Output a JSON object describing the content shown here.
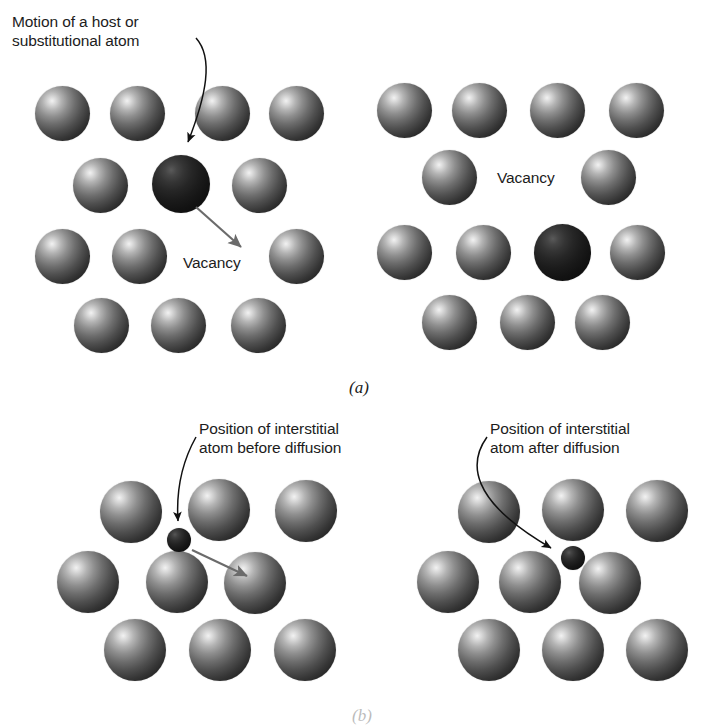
{
  "figure": {
    "captions": {
      "a": "(a)",
      "b": "(b)"
    }
  },
  "colors": {
    "background": "#ffffff",
    "atom_light": "#8e8e8e",
    "atom_dark": "#262626",
    "text": "#1c1c1c",
    "arrow_black": "#111111",
    "arrow_gray": "#6b6b6b"
  },
  "panel_a": {
    "name": "vacancy-diffusion",
    "caption": "(a)",
    "left": {
      "annotations": {
        "motion_label": "Motion of a host or substitutional atom",
        "motion_label_line1": "Motion of a host or",
        "motion_label_line2": "substitutional atom",
        "vacancy_label": "Vacancy"
      },
      "atoms": [
        {
          "cx": 62,
          "cy": 113,
          "r": 27.5,
          "kind": "light"
        },
        {
          "cx": 137,
          "cy": 113,
          "r": 27.5,
          "kind": "light"
        },
        {
          "cx": 222,
          "cy": 113,
          "r": 27.5,
          "kind": "light"
        },
        {
          "cx": 296,
          "cy": 113,
          "r": 27.5,
          "kind": "light"
        },
        {
          "cx": 100,
          "cy": 185,
          "r": 27.5,
          "kind": "light"
        },
        {
          "cx": 181,
          "cy": 184,
          "r": 29.0,
          "kind": "dark"
        },
        {
          "cx": 259,
          "cy": 185,
          "r": 27.5,
          "kind": "light"
        },
        {
          "cx": 62,
          "cy": 256,
          "r": 27.5,
          "kind": "light"
        },
        {
          "cx": 139,
          "cy": 256,
          "r": 27.5,
          "kind": "light"
        },
        {
          "cx": 296,
          "cy": 256,
          "r": 27.5,
          "kind": "light"
        },
        {
          "cx": 101,
          "cy": 325,
          "r": 27.5,
          "kind": "light"
        },
        {
          "cx": 178,
          "cy": 325,
          "r": 27.5,
          "kind": "light"
        },
        {
          "cx": 258,
          "cy": 325,
          "r": 27.5,
          "kind": "light"
        }
      ]
    },
    "right": {
      "annotations": {
        "vacancy_label": "Vacancy"
      },
      "atoms": [
        {
          "cx": 404,
          "cy": 110,
          "r": 27.5,
          "kind": "light"
        },
        {
          "cx": 479,
          "cy": 110,
          "r": 27.5,
          "kind": "light"
        },
        {
          "cx": 557,
          "cy": 110,
          "r": 27.5,
          "kind": "light"
        },
        {
          "cx": 636,
          "cy": 110,
          "r": 27.5,
          "kind": "light"
        },
        {
          "cx": 449,
          "cy": 177,
          "r": 27.5,
          "kind": "light"
        },
        {
          "cx": 608,
          "cy": 177,
          "r": 27.5,
          "kind": "light"
        },
        {
          "cx": 404,
          "cy": 252,
          "r": 27.5,
          "kind": "light"
        },
        {
          "cx": 483,
          "cy": 252,
          "r": 27.5,
          "kind": "light"
        },
        {
          "cx": 562,
          "cy": 252,
          "r": 28.5,
          "kind": "dark"
        },
        {
          "cx": 637,
          "cy": 252,
          "r": 27.5,
          "kind": "light"
        },
        {
          "cx": 449,
          "cy": 322,
          "r": 27.5,
          "kind": "light"
        },
        {
          "cx": 527,
          "cy": 322,
          "r": 27.5,
          "kind": "light"
        },
        {
          "cx": 602,
          "cy": 322,
          "r": 27.5,
          "kind": "light"
        }
      ]
    }
  },
  "panel_b": {
    "name": "interstitial-diffusion",
    "caption": "(b)",
    "left": {
      "annotations": {
        "label_line1": "Position of interstitial",
        "label_line2": "atom before diffusion",
        "label_full": "Position of interstitial atom before diffusion"
      },
      "atoms": [
        {
          "cx": 131,
          "cy": 512,
          "r": 31,
          "kind": "light"
        },
        {
          "cx": 219,
          "cy": 510,
          "r": 31,
          "kind": "light"
        },
        {
          "cx": 306,
          "cy": 511,
          "r": 31,
          "kind": "light"
        },
        {
          "cx": 88,
          "cy": 582,
          "r": 31,
          "kind": "light"
        },
        {
          "cx": 177,
          "cy": 582,
          "r": 31,
          "kind": "light"
        },
        {
          "cx": 255,
          "cy": 583,
          "r": 31,
          "kind": "light"
        },
        {
          "cx": 135,
          "cy": 650,
          "r": 31,
          "kind": "light"
        },
        {
          "cx": 220,
          "cy": 650,
          "r": 31,
          "kind": "light"
        },
        {
          "cx": 305,
          "cy": 650,
          "r": 31,
          "kind": "light"
        }
      ],
      "interstitial": {
        "cx": 179,
        "cy": 540,
        "r": 12,
        "kind": "small"
      }
    },
    "right": {
      "annotations": {
        "label_line1": "Position of interstitial",
        "label_line2": "atom after diffusion",
        "label_full": "Position of interstitial atom after diffusion"
      },
      "atoms": [
        {
          "cx": 489,
          "cy": 512,
          "r": 31,
          "kind": "light"
        },
        {
          "cx": 573,
          "cy": 510,
          "r": 31,
          "kind": "light"
        },
        {
          "cx": 657,
          "cy": 511,
          "r": 31,
          "kind": "light"
        },
        {
          "cx": 448,
          "cy": 582,
          "r": 31,
          "kind": "light"
        },
        {
          "cx": 530,
          "cy": 582,
          "r": 31,
          "kind": "light"
        },
        {
          "cx": 610,
          "cy": 583,
          "r": 31,
          "kind": "light"
        },
        {
          "cx": 489,
          "cy": 650,
          "r": 31,
          "kind": "light"
        },
        {
          "cx": 573,
          "cy": 650,
          "r": 31,
          "kind": "light"
        },
        {
          "cx": 657,
          "cy": 650,
          "r": 31,
          "kind": "light"
        }
      ],
      "interstitial": {
        "cx": 573,
        "cy": 558,
        "r": 12,
        "kind": "small"
      }
    }
  }
}
